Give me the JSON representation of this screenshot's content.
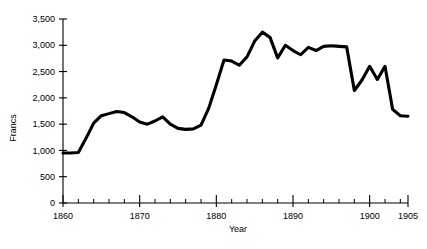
{
  "chart_data": {
    "type": "line",
    "title": "",
    "xlabel": "Year",
    "ylabel": "Francs",
    "xlim": [
      1860,
      1905
    ],
    "ylim": [
      0,
      3500
    ],
    "grid": false,
    "legend": false,
    "line_color": "#000000",
    "y_ticks": [
      0,
      500,
      1000,
      1500,
      2000,
      2500,
      3000,
      3500
    ],
    "y_tick_labels": [
      "0",
      "500",
      "1,000",
      "1,500",
      "2,000",
      "2,500",
      "3,000",
      "3,500"
    ],
    "x_ticks": [
      1860,
      1870,
      1880,
      1890,
      1900,
      1905
    ],
    "x_tick_labels": [
      "1860",
      "1870",
      "1880",
      "1890",
      "1900",
      "1905"
    ],
    "x_minor_tick_step": 2,
    "x": [
      1860,
      1861,
      1862,
      1863,
      1864,
      1865,
      1866,
      1867,
      1868,
      1869,
      1870,
      1871,
      1872,
      1873,
      1874,
      1875,
      1876,
      1877,
      1878,
      1879,
      1880,
      1881,
      1882,
      1883,
      1884,
      1885,
      1886,
      1887,
      1888,
      1889,
      1890,
      1891,
      1892,
      1893,
      1894,
      1895,
      1896,
      1897,
      1898,
      1899,
      1900,
      1901,
      1902,
      1903,
      1904,
      1905
    ],
    "values": [
      950,
      950,
      960,
      1230,
      1520,
      1660,
      1700,
      1740,
      1720,
      1640,
      1540,
      1500,
      1560,
      1640,
      1500,
      1420,
      1400,
      1410,
      1480,
      1800,
      2250,
      2720,
      2700,
      2620,
      2780,
      3080,
      3250,
      3150,
      2760,
      3000,
      2900,
      2820,
      2960,
      2900,
      2980,
      2990,
      2980,
      2970,
      2140,
      2340,
      2600,
      2350,
      2600,
      1780,
      1660,
      1650
    ],
    "series_name": "Francs"
  },
  "axes": {
    "y_axis_title": "Francs",
    "x_axis_title": "Year"
  }
}
